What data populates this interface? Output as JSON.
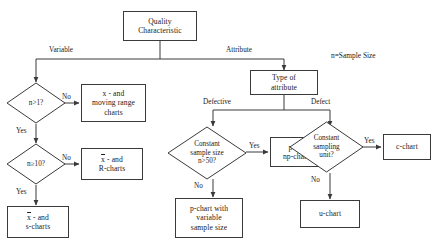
{
  "diagram": {
    "title_node": {
      "label": "Quality\nCharacteristic"
    },
    "note": {
      "text": "n=Sample Size"
    },
    "nodes": [
      {
        "id": "quality",
        "type": "box",
        "label": "Quality Characteristic"
      },
      {
        "id": "type-attr",
        "type": "box",
        "label": "Type of attribute"
      },
      {
        "id": "n-gt-1",
        "type": "diamond",
        "label": "n>1?"
      },
      {
        "id": "n-ge-10",
        "type": "diamond",
        "label": "n≥10?"
      },
      {
        "id": "x-moving-range",
        "type": "box",
        "label": "x - and moving range charts"
      },
      {
        "id": "xbar-r",
        "type": "box",
        "label": "x̄ - and R-charts"
      },
      {
        "id": "xbar-s",
        "type": "box",
        "label": "x̄ - and s-charts"
      },
      {
        "id": "const-sample",
        "type": "diamond",
        "label": "Constant sample size n>50?"
      },
      {
        "id": "p-np",
        "type": "box",
        "label": "p- or np-chart"
      },
      {
        "id": "p-variable",
        "type": "box",
        "label": "p-chart with variable sample size"
      },
      {
        "id": "const-unit",
        "type": "diamond",
        "label": "Constant sampling unit?"
      },
      {
        "id": "c-chart",
        "type": "box",
        "label": "c-chart"
      },
      {
        "id": "u-chart",
        "type": "box",
        "label": "u-chart"
      }
    ],
    "edge_labels": {
      "variable": "Variable",
      "attribute": "Attribute",
      "defective": "Defective",
      "defect": "Defect",
      "no_1": "No",
      "yes_1": "Yes",
      "no_2": "No",
      "yes_2": "Yes",
      "yes_3": "Yes",
      "no_3": "No",
      "yes_4": "Yes",
      "no_4": "No"
    },
    "node_text": {
      "quality_l1": "Quality",
      "quality_l2": "Characteristic",
      "type_attr_l1": "Type of",
      "type_attr_l2": "attribute",
      "n_gt_1": "n>1?",
      "n_ge_10": "n≥10?",
      "xmr_l1": "x - and",
      "xmr_l2": "moving range",
      "xmr_l3": "charts",
      "xbar_r_l1": "x - and",
      "xbar_r_l2": "R-charts",
      "xbar_s_l1": "x - and",
      "xbar_s_l2": "s-charts",
      "const_sample_l1": "Constant",
      "const_sample_l2": "sample size",
      "const_sample_l3": "n>50?",
      "p_np_l1": "p- or",
      "p_np_l2": "np-chart",
      "p_var_l1": "p-chart with",
      "p_var_l2": "variable",
      "p_var_l3": "sample size",
      "const_unit_l1": "Constant",
      "const_unit_l2": "sampling",
      "const_unit_l3": "unit?",
      "c_chart": "c-chart",
      "u_chart": "u-chart",
      "xbar_glyph": "x"
    },
    "colors": {
      "stroke": "#3a3a3a",
      "text": "#1a1a1a",
      "background": "#ffffff"
    }
  }
}
